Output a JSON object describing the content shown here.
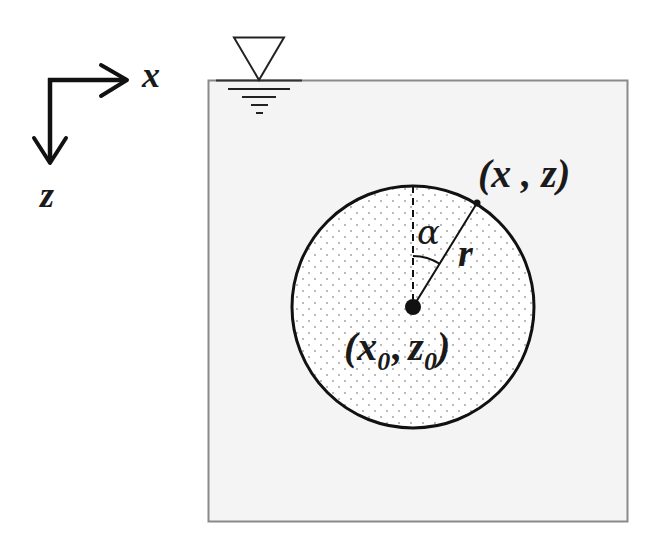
{
  "diagram": {
    "axes": {
      "x_label": "x",
      "z_label": "z"
    },
    "free_surface": {
      "symbol": "water-level-triangle"
    },
    "fluid_domain": {
      "fill": "#f4f4f4",
      "border": "#8a8a8a"
    },
    "cylinder": {
      "center_label": {
        "open": "(",
        "x": "x",
        "x_sub": "0",
        "sep": ",",
        "z": "z",
        "z_sub": "0",
        "close": ")"
      },
      "point_label": "(x , z)",
      "radius_label": "r",
      "angle_label": "α",
      "fill": "#ffffff",
      "dot_color": "#9a9a9a",
      "outline": "#111111"
    },
    "colors": {
      "ink": "#111111",
      "box_border": "#8a8a8a",
      "box_fill": "#f4f4f4"
    }
  }
}
